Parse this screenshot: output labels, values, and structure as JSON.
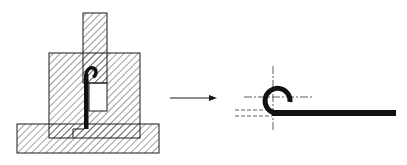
{
  "diagram": {
    "type": "engineering-section-diagram",
    "colors": {
      "background": "#ffffff",
      "line": "#1a1a1a",
      "hatch": "#2a2a2a",
      "part": "#111111"
    },
    "left_view": {
      "label": "die-assembly-section",
      "components": [
        "base-plate",
        "die-block",
        "punch",
        "curled-strip"
      ]
    },
    "arrow": {
      "direction": "right",
      "meaning": "results-in"
    },
    "right_view": {
      "label": "curled-part",
      "features": [
        "curl",
        "flat-strip",
        "vertical-centerline",
        "horizontal-centerline",
        "dashed-reference-lines"
      ]
    }
  }
}
